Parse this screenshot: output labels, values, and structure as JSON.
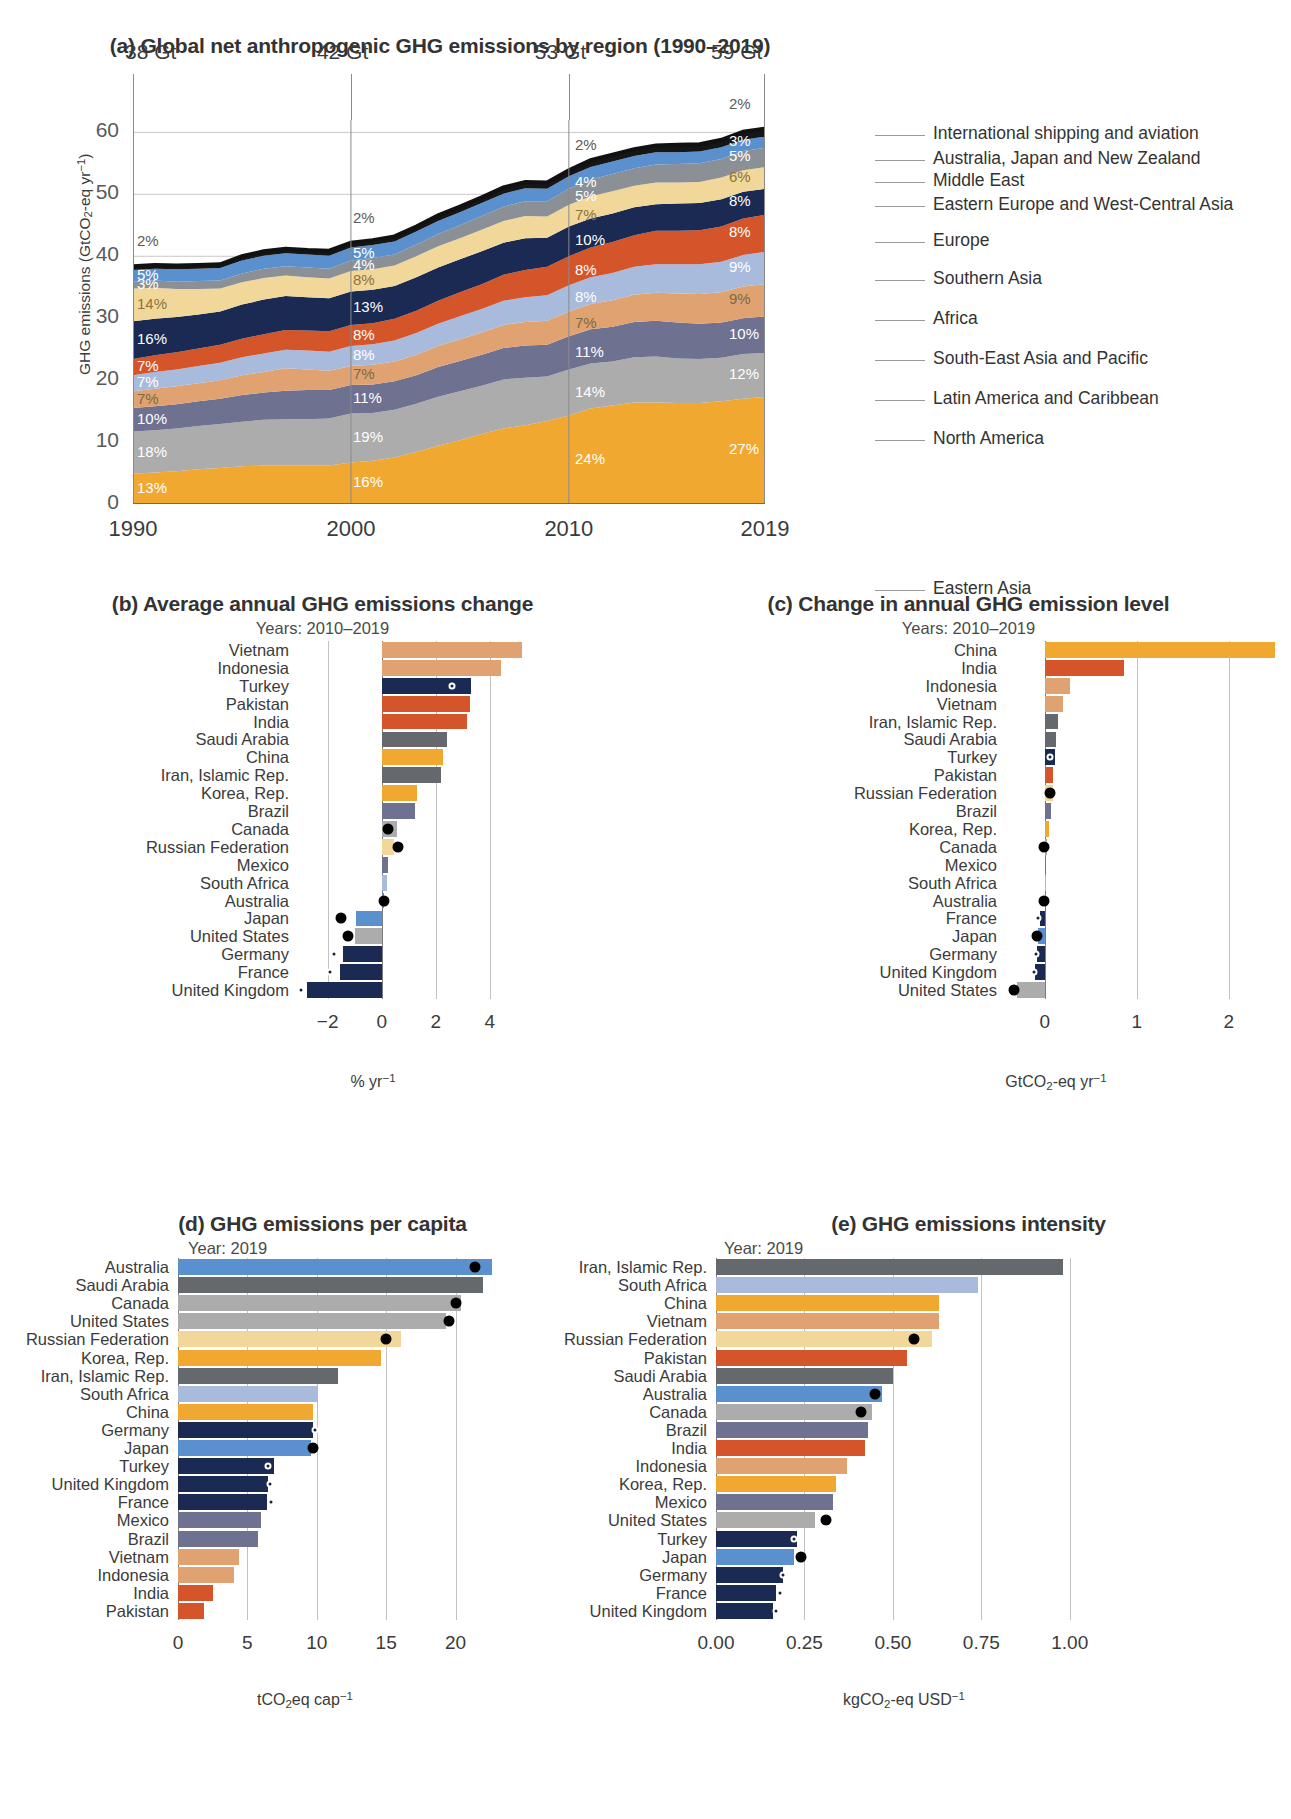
{
  "panel_a": {
    "title": "(a) Global net anthropogenic GHG emissions by region (1990–2019)",
    "ylabel": "GHG emissions (GtCO2-eq yr-1)",
    "y_ticks": [
      "0",
      "10",
      "20",
      "30",
      "40",
      "50",
      "60"
    ],
    "x_ticks": [
      "1990",
      "2000",
      "2010",
      "2019"
    ],
    "gt_labels": [
      "38 Gt",
      "42 Gt",
      "53 Gt",
      "59 Gt"
    ],
    "legend": [
      "International shipping and aviation",
      "Australia, Japan and New Zealand",
      "Middle East",
      "Eastern Europe and West-Central Asia",
      "Europe",
      "Southern Asia",
      "Africa",
      "South-East Asia and Pacific",
      "Latin America and Caribbean",
      "North America",
      "Eastern Asia"
    ],
    "pct_1990": [
      "2%",
      "5%",
      "3%",
      "14%",
      "16%",
      "7%",
      "7%",
      "7%",
      "10%",
      "18%",
      "13%"
    ],
    "pct_2000": [
      "2%",
      "5%",
      "4%",
      "8%",
      "13%",
      "8%",
      "8%",
      "7%",
      "11%",
      "19%",
      "16%"
    ],
    "pct_2010": [
      "2%",
      "4%",
      "5%",
      "7%",
      "10%",
      "8%",
      "8%",
      "7%",
      "11%",
      "14%",
      "24%"
    ],
    "pct_2019": [
      "2%",
      "3%",
      "5%",
      "6%",
      "8%",
      "8%",
      "9%",
      "9%",
      "10%",
      "12%",
      "27%"
    ]
  },
  "chart_data": [
    {
      "type": "area",
      "title": "(a) Global net anthropogenic GHG emissions by region (1990–2019)",
      "xlabel": "",
      "ylabel": "GHG emissions (GtCO2-eq yr-1)",
      "ylim": [
        0,
        62
      ],
      "xlim": [
        1990,
        2019
      ],
      "grid": true,
      "legend_position": "right",
      "totals": {
        "1990": 38,
        "2000": 42,
        "2010": 53,
        "2019": 59
      },
      "x": [
        1990,
        1991,
        1992,
        1993,
        1994,
        1995,
        1996,
        1997,
        1998,
        1999,
        2000,
        2001,
        2002,
        2003,
        2004,
        2005,
        2006,
        2007,
        2008,
        2009,
        2010,
        2011,
        2012,
        2013,
        2014,
        2015,
        2016,
        2017,
        2018,
        2019
      ],
      "series": [
        {
          "name": "Eastern Asia",
          "color": "#f0a830",
          "values": [
            4.9,
            5.1,
            5.3,
            5.6,
            5.8,
            6.1,
            6.2,
            6.2,
            6.2,
            6.2,
            6.7,
            7.0,
            7.5,
            8.4,
            9.4,
            10.3,
            11.3,
            12.2,
            12.7,
            13.4,
            14.3,
            15.4,
            15.9,
            16.4,
            16.4,
            16.3,
            16.3,
            16.6,
            17.0,
            17.3
          ],
          "share_1990": "13%",
          "share_2000": "16%",
          "share_2010": "24%",
          "share_2019": "27%"
        },
        {
          "name": "North America",
          "color": "#acacac",
          "values": [
            6.8,
            6.8,
            6.9,
            7.0,
            7.1,
            7.2,
            7.4,
            7.5,
            7.5,
            7.6,
            7.9,
            7.7,
            7.7,
            7.8,
            7.9,
            7.9,
            7.8,
            7.9,
            7.7,
            7.2,
            7.4,
            7.3,
            7.1,
            7.3,
            7.4,
            7.2,
            7.1,
            7.0,
            7.2,
            7.1
          ],
          "share_1990": "18%",
          "share_2000": "19%",
          "share_2010": "14%",
          "share_2019": "12%"
        },
        {
          "name": "Latin America and Caribbean",
          "color": "#6e7290",
          "values": [
            3.8,
            3.9,
            3.9,
            4.0,
            4.1,
            4.3,
            4.4,
            4.6,
            4.7,
            4.6,
            4.6,
            4.6,
            4.6,
            4.6,
            4.8,
            4.9,
            5.0,
            5.1,
            5.2,
            5.1,
            5.4,
            5.5,
            5.6,
            5.7,
            5.8,
            5.8,
            5.7,
            5.7,
            5.8,
            5.9
          ],
          "share_1990": "10%",
          "share_2000": "11%",
          "share_2010": "11%",
          "share_2019": "10%"
        },
        {
          "name": "South-East Asia and Pacific",
          "color": "#e0a271",
          "values": [
            2.7,
            2.8,
            2.9,
            2.9,
            3.0,
            3.2,
            3.3,
            3.6,
            3.3,
            3.1,
            3.1,
            3.2,
            3.2,
            3.3,
            3.4,
            3.5,
            3.6,
            3.7,
            3.8,
            3.9,
            4.0,
            4.1,
            4.3,
            4.4,
            4.5,
            4.7,
            4.8,
            4.9,
            5.1,
            5.2
          ],
          "share_1990": "7%",
          "share_2000": "7%",
          "share_2010": "7%",
          "share_2019": "9%"
        },
        {
          "name": "Africa",
          "color": "#a9bbdd",
          "values": [
            2.6,
            2.7,
            2.7,
            2.8,
            2.8,
            2.9,
            3.0,
            3.0,
            3.1,
            3.1,
            3.2,
            3.3,
            3.4,
            3.5,
            3.6,
            3.7,
            3.8,
            3.9,
            4.0,
            4.1,
            4.2,
            4.3,
            4.4,
            4.5,
            4.6,
            4.7,
            4.8,
            4.9,
            5.1,
            5.2
          ],
          "share_1990": "7%",
          "share_2000": "8%",
          "share_2010": "8%",
          "share_2019": "9%"
        },
        {
          "name": "Southern Asia",
          "color": "#d4552a",
          "values": [
            2.6,
            2.7,
            2.8,
            2.8,
            2.9,
            3.0,
            3.1,
            3.2,
            3.2,
            3.3,
            3.4,
            3.4,
            3.5,
            3.6,
            3.7,
            3.9,
            4.0,
            4.2,
            4.4,
            4.6,
            4.7,
            4.8,
            5.0,
            5.1,
            5.4,
            5.4,
            5.5,
            5.7,
            5.9,
            6.0
          ],
          "share_1990": "7%",
          "share_2000": "8%",
          "share_2010": "8%",
          "share_2019": "8%"
        },
        {
          "name": "Europe",
          "color": "#1b2a52",
          "values": [
            6.1,
            5.9,
            5.7,
            5.5,
            5.4,
            5.5,
            5.6,
            5.5,
            5.4,
            5.3,
            5.4,
            5.4,
            5.3,
            5.4,
            5.4,
            5.3,
            5.3,
            5.2,
            5.1,
            4.7,
            4.8,
            4.7,
            4.6,
            4.5,
            4.3,
            4.4,
            4.4,
            4.4,
            4.3,
            4.2
          ],
          "share_1990": "16%",
          "share_2000": "13%",
          "share_2010": "10%",
          "share_2019": "8%"
        },
        {
          "name": "Eastern Europe and West-Central Asia",
          "color": "#f2d79a",
          "values": [
            5.3,
            5.0,
            4.5,
            4.1,
            3.7,
            3.6,
            3.5,
            3.3,
            3.2,
            3.2,
            3.3,
            3.3,
            3.3,
            3.4,
            3.4,
            3.4,
            3.5,
            3.5,
            3.6,
            3.4,
            3.5,
            3.6,
            3.6,
            3.5,
            3.5,
            3.4,
            3.4,
            3.5,
            3.5,
            3.5
          ],
          "share_1990": "14%",
          "share_2000": "8%",
          "share_2010": "7%",
          "share_2019": "6%"
        },
        {
          "name": "Middle East",
          "color": "#8b9097",
          "values": [
            1.1,
            1.2,
            1.2,
            1.3,
            1.3,
            1.4,
            1.5,
            1.5,
            1.6,
            1.6,
            1.7,
            1.8,
            1.8,
            1.9,
            2.0,
            2.1,
            2.2,
            2.3,
            2.4,
            2.5,
            2.6,
            2.7,
            2.8,
            2.8,
            2.9,
            3.0,
            3.0,
            3.0,
            3.1,
            3.1
          ],
          "share_1990": "3%",
          "share_2000": "4%",
          "share_2010": "5%",
          "share_2019": "5%"
        },
        {
          "name": "Australia, Japan and New Zealand",
          "color": "#5b90ce",
          "values": [
            1.9,
            1.9,
            2.0,
            2.0,
            2.0,
            2.1,
            2.1,
            2.1,
            2.1,
            2.1,
            2.1,
            2.1,
            2.1,
            2.1,
            2.1,
            2.1,
            2.1,
            2.1,
            2.1,
            2.0,
            2.0,
            2.0,
            2.0,
            2.0,
            2.0,
            1.9,
            1.9,
            1.9,
            1.8,
            1.8
          ],
          "share_1990": "5%",
          "share_2000": "5%",
          "share_2010": "4%",
          "share_2019": "3%"
        },
        {
          "name": "International shipping and aviation",
          "color": "#161616",
          "values": [
            0.6,
            0.6,
            0.6,
            0.6,
            0.6,
            0.7,
            0.7,
            0.7,
            0.7,
            0.8,
            0.8,
            0.8,
            0.8,
            0.8,
            0.9,
            0.9,
            0.9,
            1.0,
            1.0,
            1.0,
            1.0,
            1.1,
            1.1,
            1.1,
            1.1,
            1.2,
            1.2,
            1.2,
            1.3,
            1.3
          ],
          "share_1990": "2%",
          "share_2000": "2%",
          "share_2010": "2%",
          "share_2019": "2%"
        }
      ]
    },
    {
      "type": "bar",
      "orientation": "horizontal",
      "title": "(b) Average annual GHG emissions change",
      "subtitle": "Years: 2010–2019",
      "xlabel": "% yr-1",
      "ylabel": "",
      "xlim": [
        -3.1,
        5.6
      ],
      "ticks": [
        -2,
        0,
        2,
        4
      ],
      "tick_labels": [
        "−2",
        "0",
        "2",
        "4"
      ],
      "categories": [
        "Vietnam",
        "Indonesia",
        "Turkey",
        "Pakistan",
        "India",
        "Saudi Arabia",
        "China",
        "Iran, Islamic Rep.",
        "Korea, Rep.",
        "Brazil",
        "Canada",
        "Russian Federation",
        "Mexico",
        "South Africa",
        "Australia",
        "Japan",
        "United States",
        "Germany",
        "France",
        "United Kingdom"
      ],
      "values": [
        5.2,
        4.4,
        3.3,
        3.25,
        3.15,
        2.4,
        2.25,
        2.2,
        1.3,
        1.25,
        0.55,
        0.45,
        0.25,
        0.2,
        0.1,
        -0.95,
        -1.0,
        -1.45,
        -1.55,
        -2.75
      ],
      "colors": [
        "#e0a271",
        "#e0a271",
        "#1b2a52",
        "#d4552a",
        "#d4552a",
        "#65696e",
        "#f0a830",
        "#65696e",
        "#f0a830",
        "#6e7290",
        "#acacac",
        "#f2d79a",
        "#6e7290",
        "#a9bbdd",
        "#5b90ce",
        "#5b90ce",
        "#acacac",
        "#1b2a52",
        "#1b2a52",
        "#1b2a52"
      ],
      "dots": [
        null,
        null,
        2.6,
        null,
        null,
        null,
        null,
        null,
        null,
        null,
        0.25,
        0.6,
        null,
        null,
        0.1,
        -1.5,
        -1.25,
        -1.75,
        -1.9,
        -3.0
      ]
    },
    {
      "type": "bar",
      "orientation": "horizontal",
      "title": "(c) Change in annual GHG emission level",
      "subtitle": "Years: 2010–2019",
      "xlabel": "GtCO2-eq yr-1",
      "ylabel": "",
      "xlim": [
        -0.42,
        2.62
      ],
      "ticks": [
        0,
        1,
        2
      ],
      "tick_labels": [
        "0",
        "1",
        "2"
      ],
      "categories": [
        "China",
        "India",
        "Indonesia",
        "Vietnam",
        "Iran, Islamic Rep.",
        "Saudi Arabia",
        "Turkey",
        "Pakistan",
        "Russian Federation",
        "Brazil",
        "Korea, Rep.",
        "Canada",
        "Mexico",
        "South Africa",
        "Australia",
        "France",
        "Japan",
        "Germany",
        "United Kingdom",
        "United States"
      ],
      "values": [
        2.5,
        0.86,
        0.28,
        0.2,
        0.14,
        0.12,
        0.11,
        0.09,
        0.085,
        0.07,
        0.045,
        0.02,
        0.012,
        0.008,
        0.004,
        -0.055,
        -0.075,
        -0.085,
        -0.11,
        -0.3
      ],
      "colors": [
        "#f0a830",
        "#d4552a",
        "#e0a271",
        "#e0a271",
        "#65696e",
        "#65696e",
        "#1b2a52",
        "#d4552a",
        "#f2d79a",
        "#6e7290",
        "#f0a830",
        "#acacac",
        "#6e7290",
        "#a9bbdd",
        "#5b90ce",
        "#1b2a52",
        "#5b90ce",
        "#1b2a52",
        "#1b2a52",
        "#acacac"
      ],
      "dots": [
        null,
        null,
        null,
        null,
        null,
        null,
        0.06,
        null,
        0.06,
        null,
        null,
        -0.01,
        null,
        null,
        -0.005,
        -0.07,
        -0.085,
        -0.095,
        -0.12,
        -0.33
      ]
    },
    {
      "type": "bar",
      "orientation": "horizontal",
      "title": "(d) GHG emissions per capita",
      "subtitle": "Year: 2019",
      "xlabel": "tCO2eq cap-1",
      "ylabel": "",
      "xlim": [
        0,
        24.5
      ],
      "ticks": [
        0,
        5,
        10,
        15,
        20
      ],
      "tick_labels": [
        "0",
        "5",
        "10",
        "15",
        "20"
      ],
      "categories": [
        "Australia",
        "Saudi Arabia",
        "Canada",
        "United States",
        "Russian Federation",
        "Korea, Rep.",
        "Iran, Islamic Rep.",
        "South Africa",
        "China",
        "Germany",
        "Japan",
        "Turkey",
        "United Kingdom",
        "France",
        "Mexico",
        "Brazil",
        "Vietnam",
        "Indonesia",
        "India",
        "Pakistan"
      ],
      "values": [
        22.6,
        22.0,
        20.4,
        19.3,
        16.1,
        14.6,
        11.5,
        10.1,
        9.7,
        9.7,
        9.6,
        6.9,
        6.5,
        6.4,
        6.0,
        5.8,
        4.4,
        4.0,
        2.5,
        1.9
      ],
      "colors": [
        "#5b90ce",
        "#65696e",
        "#acacac",
        "#acacac",
        "#f2d79a",
        "#f0a830",
        "#65696e",
        "#a9bbdd",
        "#f0a830",
        "#1b2a52",
        "#5b90ce",
        "#1b2a52",
        "#1b2a52",
        "#1b2a52",
        "#6e7290",
        "#6e7290",
        "#e0a271",
        "#e0a271",
        "#d4552a",
        "#d4552a"
      ],
      "dots": [
        21.4,
        null,
        20.0,
        19.5,
        15.0,
        null,
        null,
        null,
        null,
        9.9,
        9.7,
        6.5,
        6.6,
        6.7,
        null,
        null,
        null,
        null,
        null,
        null
      ]
    },
    {
      "type": "bar",
      "orientation": "horizontal",
      "title": "(e) GHG emissions intensity",
      "subtitle": "Year: 2019",
      "xlabel": "kgCO2-eq USD-1",
      "ylabel": "",
      "xlim": [
        0,
        1.06
      ],
      "ticks": [
        0.0,
        0.25,
        0.5,
        0.75,
        1.0
      ],
      "tick_labels": [
        "0.00",
        "0.25",
        "0.50",
        "0.75",
        "1.00"
      ],
      "categories": [
        "Iran, Islamic Rep.",
        "South Africa",
        "China",
        "Vietnam",
        "Russian Federation",
        "Pakistan",
        "Saudi Arabia",
        "Australia",
        "Canada",
        "Brazil",
        "India",
        "Indonesia",
        "Korea, Rep.",
        "Mexico",
        "United States",
        "Turkey",
        "Japan",
        "Germany",
        "France",
        "United Kingdom"
      ],
      "values": [
        0.98,
        0.74,
        0.63,
        0.63,
        0.61,
        0.54,
        0.5,
        0.47,
        0.44,
        0.43,
        0.42,
        0.37,
        0.34,
        0.33,
        0.28,
        0.23,
        0.22,
        0.19,
        0.17,
        0.16
      ],
      "colors": [
        "#65696e",
        "#a9bbdd",
        "#f0a830",
        "#e0a271",
        "#f2d79a",
        "#d4552a",
        "#65696e",
        "#5b90ce",
        "#acacac",
        "#6e7290",
        "#d4552a",
        "#e0a271",
        "#f0a830",
        "#6e7290",
        "#acacac",
        "#1b2a52",
        "#5b90ce",
        "#1b2a52",
        "#1b2a52",
        "#1b2a52"
      ],
      "dots": [
        null,
        null,
        null,
        null,
        0.56,
        null,
        null,
        0.45,
        0.41,
        null,
        null,
        null,
        null,
        null,
        0.31,
        0.22,
        0.24,
        0.19,
        0.18,
        0.17
      ]
    }
  ]
}
